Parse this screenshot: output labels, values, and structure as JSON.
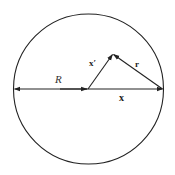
{
  "diagram": {
    "type": "geometry-vector-diagram",
    "circle": {
      "cx": 88.5,
      "cy": 89,
      "r": 75,
      "stroke": "#222222"
    },
    "vectors": [
      {
        "id": "R",
        "label": "R",
        "style": "italic",
        "from": [
          88,
          89
        ],
        "to": [
          14,
          89
        ],
        "description": "radius, double-headed to left edge"
      },
      {
        "id": "x",
        "label": "x",
        "style": "bold",
        "from": [
          88,
          89
        ],
        "to": [
          163,
          89
        ]
      },
      {
        "id": "x_prime",
        "label": "x′",
        "style": "bold",
        "from": [
          88,
          89
        ],
        "to": [
          113,
          54
        ]
      },
      {
        "id": "r",
        "label": "r",
        "style": "bold",
        "from": [
          163,
          89
        ],
        "to": [
          113,
          54
        ]
      }
    ],
    "labels": {
      "R": "R",
      "x": "x",
      "x_prime": "x′",
      "r": "r"
    },
    "colors": {
      "stroke": "#222222",
      "background": "#ffffff"
    }
  }
}
